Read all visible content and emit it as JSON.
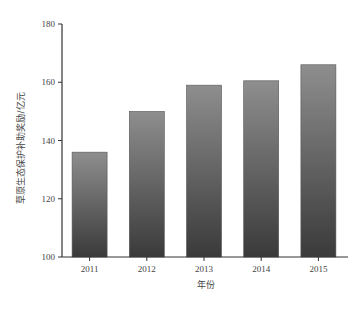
{
  "chart_data": {
    "type": "bar",
    "title": "",
    "xlabel": "年份",
    "ylabel": "草原生态保护补助奖励/亿元",
    "categories": [
      "2011",
      "2012",
      "2013",
      "2014",
      "2015"
    ],
    "values": [
      136,
      150,
      159,
      160.5,
      166
    ],
    "ylim": [
      100,
      180
    ],
    "yticks": [
      100,
      120,
      140,
      160,
      180
    ],
    "grid": false,
    "legend": null,
    "bar_fill": {
      "top": "#8e8e8e",
      "bottom": "#3a3a3a"
    }
  }
}
